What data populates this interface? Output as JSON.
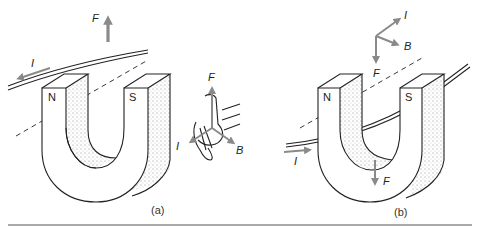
{
  "figure": {
    "panels": [
      {
        "id": "a",
        "caption": "(a)",
        "magnet": {
          "left_pole": "N",
          "right_pole": "S"
        },
        "vectors": {
          "force": "F",
          "current": "I"
        },
        "right_hand_rule": {
          "force": "F",
          "current": "I",
          "field": "B"
        }
      },
      {
        "id": "b",
        "caption": "(b)",
        "magnet": {
          "left_pole": "N",
          "right_pole": "S"
        },
        "vectors": {
          "force": "F",
          "current": "I"
        },
        "triad": {
          "current": "I",
          "field": "B",
          "force": "F"
        }
      }
    ],
    "colors": {
      "arrow": "#8a8a8a",
      "line": "#222222",
      "stipple": "#777777"
    }
  }
}
